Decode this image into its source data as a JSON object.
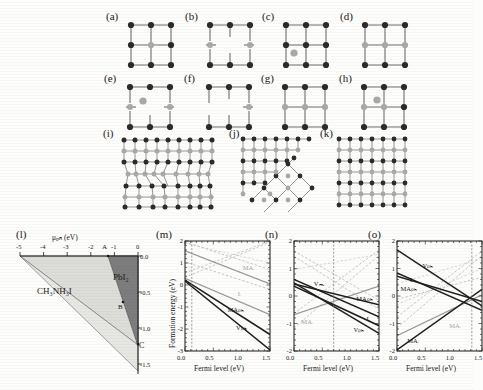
{
  "figure": {
    "caption_letters": [
      "(a)",
      "(b)",
      "(c)",
      "(d)",
      "(e)",
      "(f)",
      "(g)",
      "(h)",
      "(i)",
      "(j)",
      "(k)",
      "(l)",
      "(m)",
      "(n)",
      "(o)"
    ],
    "colors": {
      "dark_atom": "#2b2b2b",
      "gray_atom": "#8f8f8f",
      "light_atom": "#b9b9b9",
      "bond": "#6f6f6f",
      "region_fill_light": "#dcdcd8",
      "region_fill_dark": "#7d7d7d",
      "axis": "#1a1a1a",
      "curve_black": "#1f1f1f",
      "curve_gray": "#9a9a9a",
      "curve_faint": "#c3c3c3"
    }
  },
  "lattices": {
    "row1": [
      {
        "letter": "(a)",
        "name": "perfect-lattice-a"
      },
      {
        "letter": "(b)",
        "name": "vacancy-lattice-b"
      },
      {
        "letter": "(c)",
        "name": "interstitial-lattice-c"
      },
      {
        "letter": "(d)",
        "name": "antisite-lattice-d"
      }
    ],
    "row2": [
      {
        "letter": "(e)",
        "name": "defect-lattice-e"
      },
      {
        "letter": "(f)",
        "name": "defect-lattice-f"
      },
      {
        "letter": "(g)",
        "name": "defect-lattice-g"
      },
      {
        "letter": "(h)",
        "name": "defect-lattice-h"
      }
    ],
    "row3": [
      {
        "letter": "(i)",
        "name": "large-lattice-i"
      },
      {
        "letter": "(j)",
        "name": "grain-boundary-lattice-j"
      },
      {
        "letter": "(k)",
        "name": "large-lattice-k"
      }
    ]
  },
  "phase_diagram": {
    "letter": "(l)",
    "xlabel": "μₚₕ (eV)",
    "ylabel": "μᵢ(eV)",
    "xticks": [
      "-5",
      "-4",
      "-3",
      "-2",
      "-1",
      "0"
    ],
    "yticks": [
      "0.0",
      "-0.5",
      "-1.0",
      "-1.5"
    ],
    "xlim": [
      -5,
      0
    ],
    "ylim": [
      -1.7,
      0.05
    ],
    "regions": [
      {
        "label": "CH₃NH₃I",
        "name": "region-ch3nh3i"
      },
      {
        "label": "PbI₂",
        "name": "region-pbi2"
      }
    ],
    "points": [
      {
        "label": "A",
        "name": "point-a",
        "x": -2.25,
        "y": 0.0
      },
      {
        "label": "B",
        "name": "point-b",
        "x": -1.55,
        "y": -0.62
      },
      {
        "label": "C",
        "name": "point-c",
        "x": -0.1,
        "y": -1.12
      }
    ]
  },
  "chart_data": [
    {
      "type": "line",
      "letter": "(m)",
      "title": "",
      "xlabel": "Fermi level (eV)",
      "ylabel": "Formation energy (eV)",
      "xlim": [
        0.0,
        1.5
      ],
      "ylim": [
        -3,
        2
      ],
      "xticks": [
        "0.0",
        "0.5",
        "1.0",
        "1.5"
      ],
      "yticks": [
        "-3",
        "-2",
        "-1",
        "0",
        "1",
        "2"
      ],
      "fermi_marker": 0.12,
      "grid": false,
      "legend": "inline-labels",
      "annotations": [
        {
          "text": "MAᵢ",
          "name": "label-ma-i",
          "x": 1.02,
          "y": 0.78,
          "style": "gray"
        },
        {
          "text": "Iᵢ",
          "name": "label-i-i",
          "x": 0.93,
          "y": -0.42,
          "style": "gray"
        },
        {
          "text": "MAₚₕ",
          "name": "label-ma-pb",
          "x": 0.75,
          "y": -1.12,
          "style": "black"
        },
        {
          "text": "Vₚₕ",
          "name": "label-v-pb",
          "x": 0.9,
          "y": -1.95,
          "style": "black"
        }
      ],
      "series": [
        {
          "name": "MA_Pb",
          "style": "black",
          "points": [
            [
              0.0,
              0.22
            ],
            [
              1.5,
              -2.25
            ]
          ]
        },
        {
          "name": "V_Pb",
          "style": "black",
          "points": [
            [
              0.0,
              0.18
            ],
            [
              1.5,
              -2.95
            ]
          ]
        },
        {
          "name": "I_i",
          "style": "gray",
          "points": [
            [
              0.0,
              0.3
            ],
            [
              1.5,
              -1.35
            ]
          ]
        },
        {
          "name": "MA_i",
          "style": "gray",
          "points": [
            [
              0.0,
              1.55
            ],
            [
              1.5,
              0.05
            ]
          ]
        },
        {
          "name": "V_I",
          "style": "gray-dashed",
          "points": [
            [
              0.0,
              0.35
            ],
            [
              1.5,
              1.95
            ]
          ]
        },
        {
          "name": "Pb_i",
          "style": "gray-dashed",
          "points": [
            [
              0.0,
              0.55
            ],
            [
              1.5,
              2.0
            ]
          ]
        },
        {
          "name": "V_MA",
          "style": "gray-dashed",
          "points": [
            [
              0.0,
              1.05
            ],
            [
              1.5,
              -0.2
            ]
          ]
        },
        {
          "name": "Pb_MA",
          "style": "gray-dashed",
          "points": [
            [
              0.0,
              1.95
            ],
            [
              1.5,
              0.7
            ]
          ]
        },
        {
          "name": "I_Pb",
          "style": "faint",
          "points": [
            [
              0.0,
              1.9
            ],
            [
              1.5,
              1.0
            ]
          ]
        }
      ]
    },
    {
      "type": "line",
      "letter": "(n)",
      "title": "",
      "xlabel": "Fermi level (eV)",
      "ylabel": "",
      "xlim": [
        0.0,
        1.5
      ],
      "ylim": [
        -2,
        3
      ],
      "xticks": [
        "0.0",
        "0.5",
        "1.0",
        "1.5"
      ],
      "yticks": [
        "-2",
        "-1",
        "0",
        "1",
        "2"
      ],
      "fermi_marker": 0.7,
      "grid": false,
      "legend": "inline-labels",
      "annotations": [
        {
          "text": "Vₘₐ",
          "name": "label-v-ma",
          "x": 0.35,
          "y": 1.05,
          "style": "black"
        },
        {
          "text": "MAₚₕ",
          "name": "label-ma-pb-n",
          "x": 1.1,
          "y": 0.35,
          "style": "black"
        },
        {
          "text": "Iᵢ",
          "name": "label-i-i-n",
          "x": 1.28,
          "y": -0.55,
          "style": "black"
        },
        {
          "text": "Vₚₕ",
          "name": "label-v-pb-n",
          "x": 1.05,
          "y": -1.05,
          "style": "black"
        },
        {
          "text": "MAᵢ",
          "name": "label-ma-i-n",
          "x": 0.13,
          "y": -0.7,
          "style": "gray"
        }
      ],
      "series": [
        {
          "name": "V_MA",
          "style": "black",
          "points": [
            [
              0.0,
              1.25
            ],
            [
              1.5,
              -0.45
            ]
          ]
        },
        {
          "name": "MA_Pb",
          "style": "black",
          "points": [
            [
              0.0,
              1.05
            ],
            [
              1.5,
              0.1
            ]
          ]
        },
        {
          "name": "V_Pb",
          "style": "black",
          "points": [
            [
              0.0,
              1.1
            ],
            [
              1.5,
              -1.2
            ]
          ]
        },
        {
          "name": "I_i",
          "style": "black",
          "points": [
            [
              0.0,
              0.95
            ],
            [
              1.5,
              -0.85
            ]
          ]
        },
        {
          "name": "MA_i",
          "style": "gray",
          "points": [
            [
              0.0,
              -0.35
            ],
            [
              1.5,
              0.95
            ]
          ]
        },
        {
          "name": "V_I",
          "style": "gray-dashed",
          "points": [
            [
              0.0,
              -0.95
            ],
            [
              1.5,
              2.35
            ]
          ]
        },
        {
          "name": "Pb_i",
          "style": "gray-dashed",
          "points": [
            [
              0.0,
              -0.3
            ],
            [
              1.5,
              2.6
            ]
          ]
        },
        {
          "name": "I_MA",
          "style": "gray-dashed",
          "points": [
            [
              0.0,
              2.55
            ],
            [
              1.5,
              0.3
            ]
          ]
        },
        {
          "name": "I_Pb",
          "style": "gray-dashed",
          "points": [
            [
              0.0,
              2.3
            ],
            [
              1.5,
              -0.1
            ]
          ]
        },
        {
          "name": "Pb_MA",
          "style": "faint",
          "points": [
            [
              0.0,
              1.7
            ],
            [
              1.5,
              2.4
            ]
          ]
        }
      ]
    },
    {
      "type": "line",
      "letter": "(o)",
      "title": "",
      "xlabel": "Fermi level (eV)",
      "ylabel": "",
      "xlim": [
        0.0,
        1.5
      ],
      "ylim": [
        -2,
        3
      ],
      "xticks": [
        "0.0",
        "0.5",
        "1.0",
        "1.5"
      ],
      "yticks": [
        "-2",
        "-1",
        "0",
        "1",
        "2"
      ],
      "fermi_marker": 1.32,
      "grid": false,
      "legend": "inline-labels",
      "annotations": [
        {
          "text": "Vₚₕ",
          "name": "label-v-pb-o",
          "x": 0.45,
          "y": 1.85,
          "style": "black"
        },
        {
          "text": "Iᵢ",
          "name": "label-i-i-o",
          "x": 0.23,
          "y": 1.25,
          "style": "black"
        },
        {
          "text": "MAₚₕ",
          "name": "label-ma-pb-o",
          "x": 0.06,
          "y": 0.8,
          "style": "black"
        },
        {
          "text": "MAᵢ",
          "name": "label-ma-i-o",
          "x": 0.92,
          "y": -0.85,
          "style": "gray"
        },
        {
          "text": "MAᵢ",
          "name": "label-ma-i2-o",
          "x": 0.18,
          "y": -1.55,
          "style": "black"
        }
      ],
      "series": [
        {
          "name": "V_Pb",
          "style": "black",
          "points": [
            [
              0.0,
              2.6
            ],
            [
              1.5,
              0.05
            ]
          ]
        },
        {
          "name": "I_i",
          "style": "black",
          "points": [
            [
              0.0,
              1.55
            ],
            [
              1.5,
              -0.15
            ]
          ]
        },
        {
          "name": "MA_Pb",
          "style": "black",
          "points": [
            [
              0.0,
              1.4
            ],
            [
              1.5,
              0.25
            ]
          ]
        },
        {
          "name": "MA_I",
          "style": "black",
          "points": [
            [
              0.0,
              -1.95
            ],
            [
              1.5,
              0.8
            ]
          ]
        },
        {
          "name": "MA_i",
          "style": "gray",
          "points": [
            [
              0.0,
              -1.3
            ],
            [
              1.5,
              0.55
            ]
          ]
        },
        {
          "name": "V_I",
          "style": "gray-dashed",
          "points": [
            [
              0.0,
              -0.95
            ],
            [
              1.5,
              2.35
            ]
          ]
        },
        {
          "name": "Pb_i",
          "style": "gray-dashed",
          "points": [
            [
              0.0,
              -0.45
            ],
            [
              1.5,
              2.55
            ]
          ]
        },
        {
          "name": "V_MA",
          "style": "gray-dashed",
          "points": [
            [
              0.0,
              0.35
            ],
            [
              1.5,
              1.35
            ]
          ]
        },
        {
          "name": "I_Pb",
          "style": "faint",
          "points": [
            [
              0.0,
              1.05
            ],
            [
              1.5,
              2.2
            ]
          ]
        },
        {
          "name": "Pb_MA",
          "style": "faint",
          "points": [
            [
              0.0,
              0.1
            ],
            [
              1.5,
              1.75
            ]
          ]
        }
      ]
    }
  ]
}
